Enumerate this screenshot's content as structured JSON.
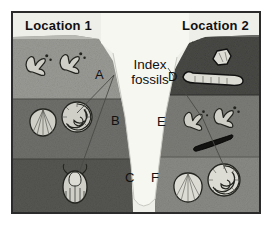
{
  "figure": {
    "center_label": "Index fossils",
    "background_color": "#ffffff",
    "frame_color": "#2b2b2b",
    "valley_color": "#f7f7f2"
  },
  "locations": [
    {
      "id": "location-1",
      "label": "Location 1",
      "side": "left",
      "layers": [
        {
          "id": "L1-top",
          "letter": "A",
          "color": "#9b9b96",
          "fossils": [
            "bird-footprint-fossil",
            "bird-footprint-fossil"
          ]
        },
        {
          "id": "L1-middle",
          "letter": "B",
          "color": "#6f6f6b",
          "fossils": [
            "clam-shell-fossil",
            "ammonite-shell-fossil"
          ]
        },
        {
          "id": "L1-bottom",
          "letter": "C",
          "color": "#565652",
          "fossils": [
            "trilobite-fossil"
          ]
        }
      ]
    },
    {
      "id": "location-2",
      "label": "Location 2",
      "side": "right",
      "layers": [
        {
          "id": "L2-top",
          "letter": "D",
          "color": "#4a4a47",
          "fossils": [
            "bone-fragment-fossil",
            "jawbone-fossil"
          ]
        },
        {
          "id": "L2-middle",
          "letter": "E",
          "color": "#7c7c78",
          "fossils": [
            "bird-footprint-fossil",
            "bird-footprint-fossil",
            "dark-sliver-fossil"
          ]
        },
        {
          "id": "L2-bottom",
          "letter": "F",
          "color": "#8a8a86",
          "fossils": [
            "scallop-shell-fossil",
            "ammonite-shell-fossil"
          ]
        }
      ]
    }
  ],
  "letters": {
    "A": "A",
    "B": "B",
    "C": "C",
    "D": "D",
    "E": "E",
    "F": "F"
  },
  "leader_lines": [
    {
      "id": "line-to-left-ammonite",
      "from": "Index fossils",
      "to": "L1-middle ammonite"
    },
    {
      "id": "line-to-left-trilobite",
      "from": "Index fossils",
      "to": "L1-bottom trilobite"
    },
    {
      "id": "line-to-right-footprint",
      "from": "Index fossils",
      "to": "L2-middle footprint"
    },
    {
      "id": "line-to-right-ammonite",
      "from": "Index fossils",
      "to": "L2-bottom ammonite"
    }
  ]
}
